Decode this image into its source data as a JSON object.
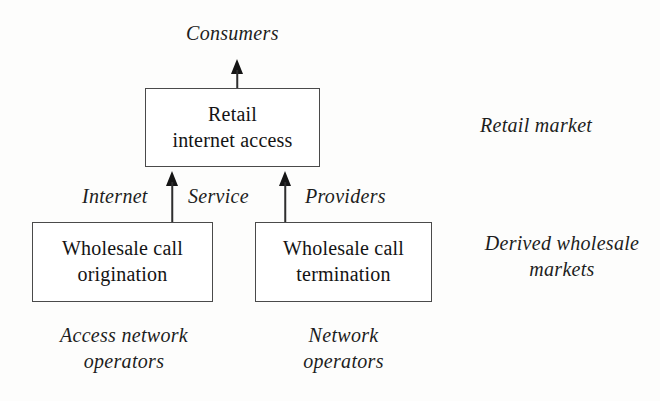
{
  "diagram": {
    "boxes": [
      {
        "id": "retail-internet-access",
        "line1": "Retail",
        "line2": "internet access"
      },
      {
        "id": "wholesale-call-origination",
        "line1": "Wholesale call",
        "line2": "origination"
      },
      {
        "id": "wholesale-call-termination",
        "line1": "Wholesale call",
        "line2": "termination"
      }
    ],
    "labels": {
      "consumers": "Consumers",
      "internet": "Internet",
      "service": "Service",
      "providers": "Providers",
      "retail_market": "Retail market",
      "derived_markets_line1": "Derived wholesale",
      "derived_markets_line2": "markets",
      "access_operators_line1": "Access network",
      "access_operators_line2": "operators",
      "network_operators_line1": "Network",
      "network_operators_line2": "operators"
    },
    "arrows": [
      {
        "id": "retail-to-consumers",
        "from": "Retail internet access",
        "to": "Consumers",
        "direction": "up"
      },
      {
        "id": "origination-to-retail",
        "from": "Wholesale call origination",
        "to": "Retail internet access",
        "direction": "up"
      },
      {
        "id": "termination-to-retail",
        "from": "Wholesale call termination",
        "to": "Retail internet access",
        "direction": "up"
      }
    ],
    "colors": {
      "background": "#fdfdfc",
      "box_border": "#4a4a4a",
      "box_fill": "#ffffff",
      "text": "#1b1b1b",
      "arrow": "#151515"
    }
  }
}
